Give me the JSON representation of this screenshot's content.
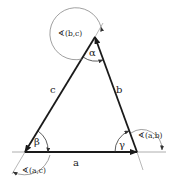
{
  "diagram": {
    "sides": {
      "a": "a",
      "b": "b",
      "c": "c"
    },
    "angles": {
      "alpha": "α",
      "beta": "β",
      "gamma": "γ"
    },
    "directed_angles": {
      "bc": "∢(b,c)",
      "ac": "∢(a,c)",
      "ab": "∢(a,b)"
    },
    "colors": {
      "stroke": "#1a1a1a",
      "thin": "#888888",
      "background": "#ffffff"
    }
  }
}
